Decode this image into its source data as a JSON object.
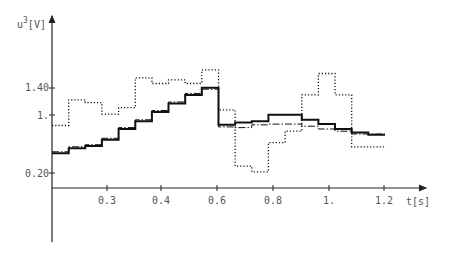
{
  "chart_data": {
    "type": "line",
    "step": true,
    "title": "",
    "xlabel": "t[s]",
    "ylabel": "u³[V]",
    "ylabel_base": "u",
    "ylabel_sup": "3",
    "ylabel_unit": "[V]",
    "x_tick_labels": [
      "0.3",
      "0.4",
      "0.6",
      "0.8",
      "1.",
      "1.2"
    ],
    "y_tick_labels": [
      "0.20",
      "1.",
      "1.40"
    ],
    "grid": false,
    "legend": null,
    "colors": {
      "axis": "#222222",
      "series": "#111111",
      "text": "#555555"
    },
    "series": [
      {
        "name": "solid",
        "style": "solid",
        "step_values_V": [
          0.46,
          0.53,
          0.56,
          0.65,
          0.8,
          0.91,
          1.04,
          1.16,
          1.28,
          1.38,
          0.86,
          0.89,
          0.91,
          1.0,
          1.0,
          0.93,
          0.87,
          0.8,
          0.75,
          0.72
        ]
      },
      {
        "name": "dash-dot",
        "style": "dashdot",
        "step_values_V": [
          0.48,
          0.55,
          0.58,
          0.67,
          0.82,
          0.93,
          1.06,
          1.18,
          1.3,
          1.36,
          0.83,
          0.82,
          0.86,
          0.87,
          0.87,
          0.84,
          0.8,
          0.77,
          0.73,
          0.73
        ]
      },
      {
        "name": "dotted",
        "style": "dotted",
        "step_values_V": [
          0.85,
          1.21,
          1.17,
          1.01,
          1.1,
          1.52,
          1.44,
          1.49,
          1.44,
          1.63,
          1.07,
          0.28,
          0.2,
          0.61,
          0.77,
          1.28,
          1.58,
          1.28,
          0.55,
          0.55
        ]
      }
    ],
    "ylim": [
      0,
      2.4
    ]
  }
}
